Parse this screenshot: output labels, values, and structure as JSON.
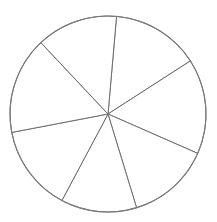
{
  "chart_data": {
    "type": "pie",
    "title": "",
    "legend": [],
    "labels": [
      "",
      "",
      "",
      "",
      "",
      "",
      ""
    ],
    "values": [
      14.5,
      15.7,
      13.7,
      12.5,
      14.2,
      16.0,
      13.4
    ],
    "start_angle_deg": 5,
    "direction": "clockwise",
    "center": [
      108,
      114
    ],
    "radius": 98,
    "fill": "#ffffff",
    "stroke": "#6e6e6e",
    "grid": false
  }
}
